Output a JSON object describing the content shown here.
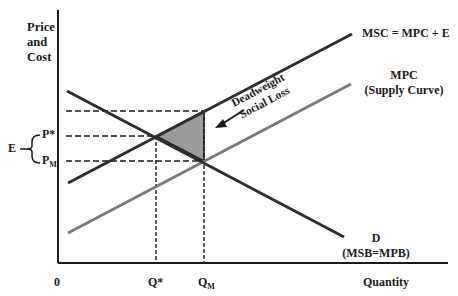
{
  "title_fragment": "",
  "axes": {
    "y_label_line1": "Price",
    "y_label_line2": "and",
    "y_label_line3": "Cost",
    "x_label": "Quantity",
    "origin_label": "0"
  },
  "curves": {
    "msc_label": "MSC = MPC + E",
    "mpc_label_line1": "MPC",
    "mpc_label_line2": "(Supply Curve)",
    "demand_label_line1": "D",
    "demand_label_line2": "(MSB=MPB)"
  },
  "annotations": {
    "deadweight_line1": "Deadweight",
    "deadweight_line2": "Social Loss",
    "externality_label": "E",
    "p_star": "P*",
    "p_m_main": "P",
    "p_m_sub": "M",
    "q_star": "Q*",
    "q_m_main": "Q",
    "q_m_sub": "M"
  },
  "colors": {
    "axis": "#1a1a1a",
    "msc_line": "#2e2e2e",
    "mpc_line": "#7a7a7a",
    "demand_line": "#2e2e2e",
    "deadweight_fill": "#9a9a9a",
    "dashed": "#1a1a1a"
  },
  "geometry": {
    "y_axis": {
      "x": 58,
      "y1": 10,
      "y2": 263
    },
    "x_axis": {
      "y": 263,
      "x1": 58,
      "x2": 448
    },
    "demand": {
      "x1": 67,
      "y1": 91,
      "x2": 344,
      "y2": 237
    },
    "msc": {
      "x1": 68,
      "y1": 183,
      "x2": 352,
      "y2": 34
    },
    "mpc": {
      "x1": 68,
      "y1": 233,
      "x2": 351,
      "y2": 84
    },
    "q_star_x": 156,
    "q_m_x": 204,
    "p_star_y": 136,
    "p_m_y": 161,
    "msc_at_qm_y": 111
  }
}
